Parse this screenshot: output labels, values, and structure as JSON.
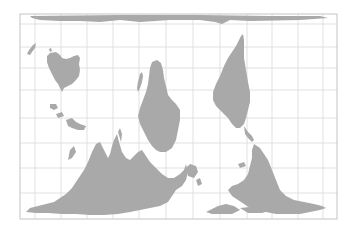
{
  "map": {
    "projection": "south-up world map",
    "orientation": "south-up",
    "colors": {
      "background": "#ffffff",
      "land": "#a9a9a9",
      "grid": "#d9d9d9",
      "frame": "#c4c4c4"
    },
    "frame": {
      "x": 20,
      "y": 14,
      "width": 317,
      "height": 205
    },
    "graticule": {
      "vertical_x": [
        35,
        61,
        87,
        113,
        139,
        166,
        193,
        220,
        247,
        272,
        298,
        323
      ],
      "horizontal_y": [
        24,
        47,
        68,
        90,
        118,
        143,
        168,
        193
      ]
    },
    "landmasses": [
      {
        "name": "Antarctica"
      },
      {
        "name": "Australia"
      },
      {
        "name": "New Zealand"
      },
      {
        "name": "Africa"
      },
      {
        "name": "Madagascar"
      },
      {
        "name": "South America"
      },
      {
        "name": "Eurasia"
      },
      {
        "name": "North America"
      },
      {
        "name": "Southeast Asia islands"
      },
      {
        "name": "Greenland"
      }
    ]
  }
}
